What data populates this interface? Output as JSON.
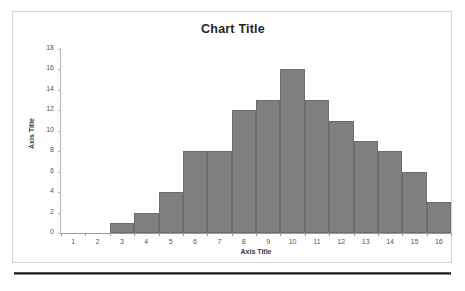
{
  "chart_data": {
    "type": "bar",
    "title": "Chart Title",
    "xlabel": "Axis Title",
    "ylabel": "Axis Title",
    "categories": [
      "1",
      "2",
      "3",
      "4",
      "5",
      "6",
      "7",
      "8",
      "9",
      "10",
      "11",
      "12",
      "13",
      "14",
      "15",
      "16"
    ],
    "values": [
      0,
      0,
      1,
      2,
      4,
      8,
      8,
      12,
      13,
      16,
      13,
      11,
      9,
      8,
      6,
      3
    ],
    "ylim": [
      0,
      18
    ],
    "ytick_values": [
      0,
      2,
      4,
      6,
      8,
      10,
      12,
      14,
      16,
      18
    ],
    "ytick_labels": [
      "0",
      "2",
      "4",
      "6",
      "8",
      "10",
      "12",
      "14",
      "16",
      "18"
    ],
    "grid": false,
    "legend": false,
    "bar_color": "#808080",
    "bar_border_color": "#6d6d6d",
    "title_color": "#262626",
    "axis_text_color": "#555555",
    "frame_color": "#d4d4d4",
    "rule_color": "#1f1f1f"
  }
}
